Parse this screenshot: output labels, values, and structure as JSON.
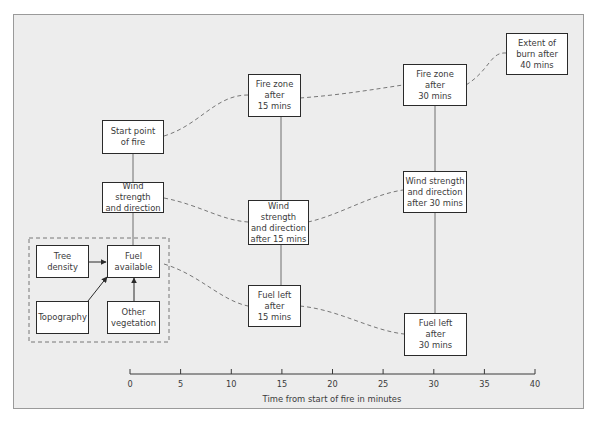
{
  "diagram": {
    "nodes": [
      {
        "id": "start",
        "label": "Start point\nof fire"
      },
      {
        "id": "wind0",
        "label": "Wind strength\nand direction"
      },
      {
        "id": "tree",
        "label": "Tree\ndensity"
      },
      {
        "id": "fuel0",
        "label": "Fuel\navailable"
      },
      {
        "id": "topo",
        "label": "Topography"
      },
      {
        "id": "veg",
        "label": "Other\nvegetation"
      },
      {
        "id": "fire15",
        "label": "Fire zone\nafter\n15 mins"
      },
      {
        "id": "wind15",
        "label": "Wind strength\nand direction\nafter 15 mins"
      },
      {
        "id": "fuel15",
        "label": "Fuel left\nafter\n15 mins"
      },
      {
        "id": "fire30",
        "label": "Fire zone\nafter\n30 mins"
      },
      {
        "id": "wind30",
        "label": "Wind strength\nand direction\nafter 30 mins"
      },
      {
        "id": "fuel30",
        "label": "Fuel left\nafter\n30 mins"
      },
      {
        "id": "extent40",
        "label": "Extent of\nburn after\n40 mins"
      }
    ],
    "edges": [
      {
        "from": "start",
        "to": "wind0",
        "style": "solid"
      },
      {
        "from": "wind0",
        "to": "fuel0",
        "style": "solid"
      },
      {
        "from": "tree",
        "to": "fuel0",
        "style": "arrow"
      },
      {
        "from": "topo",
        "to": "fuel0",
        "style": "arrow"
      },
      {
        "from": "veg",
        "to": "fuel0",
        "style": "arrow"
      },
      {
        "from": "start",
        "to": "fire15",
        "style": "dashed"
      },
      {
        "from": "wind0",
        "to": "wind15",
        "style": "dashed"
      },
      {
        "from": "fuel0",
        "to": "fuel15",
        "style": "dashed"
      },
      {
        "from": "fire15",
        "to": "wind15",
        "style": "solid"
      },
      {
        "from": "wind15",
        "to": "fuel15",
        "style": "solid"
      },
      {
        "from": "fire15",
        "to": "fire30",
        "style": "dashed"
      },
      {
        "from": "wind15",
        "to": "wind30",
        "style": "dashed"
      },
      {
        "from": "fuel15",
        "to": "fuel30",
        "style": "dashed"
      },
      {
        "from": "fire30",
        "to": "wind30",
        "style": "solid"
      },
      {
        "from": "wind30",
        "to": "fuel30",
        "style": "solid"
      },
      {
        "from": "fire30",
        "to": "extent40",
        "style": "dashed"
      }
    ],
    "group": {
      "label": "Fuel factors",
      "members": [
        "tree",
        "fuel0",
        "topo",
        "veg"
      ],
      "style": "dashed"
    }
  },
  "axis": {
    "ticks": [
      "0",
      "5",
      "10",
      "15",
      "20",
      "25",
      "30",
      "35",
      "40"
    ],
    "title": "Time from start of fire in minutes"
  },
  "colors": {
    "panel_bg": "#ededed",
    "box_border": "#2a2a2a",
    "line": "#6e6e6e",
    "text": "#3a3a3a"
  }
}
